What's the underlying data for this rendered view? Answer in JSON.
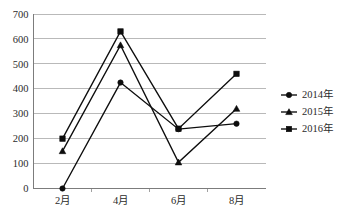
{
  "chart_data": {
    "type": "line",
    "title": "",
    "subtitle": "",
    "xlabel": "",
    "ylabel": "",
    "categories": [
      "2月",
      "4月",
      "6月",
      "8月"
    ],
    "ylim": [
      0,
      700
    ],
    "ytick_values": [
      0,
      100,
      200,
      300,
      400,
      500,
      600,
      700
    ],
    "ytick_labels": [
      "0",
      "100",
      "200",
      "300",
      "400",
      "500",
      "600",
      "700"
    ],
    "grid": true,
    "legend_position": "right",
    "series": [
      {
        "name": "2014年",
        "marker": "circle",
        "color": "#0d0d0d",
        "values": [
          0,
          425,
          238,
          260
        ]
      },
      {
        "name": "2015年",
        "marker": "triangle",
        "color": "#0d0d0d",
        "values": [
          150,
          575,
          105,
          320
        ]
      },
      {
        "name": "2016年",
        "marker": "square",
        "color": "#0d0d0d",
        "values": [
          200,
          630,
          240,
          460
        ]
      }
    ]
  },
  "legend": {
    "items": [
      {
        "label": "2014年",
        "marker": "circle"
      },
      {
        "label": "2015年",
        "marker": "triangle"
      },
      {
        "label": "2016年",
        "marker": "square"
      }
    ]
  },
  "axes": {
    "y_labels": [
      "700",
      "600",
      "500",
      "400",
      "300",
      "200",
      "100",
      "0"
    ],
    "x_labels": [
      "2月",
      "4月",
      "6月",
      "8月"
    ]
  }
}
